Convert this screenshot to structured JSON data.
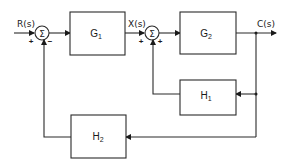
{
  "diagram": {
    "type": "control-system-block-diagram",
    "signals": {
      "input": "R(s)",
      "intermediate": "X(s)",
      "output": "C(s)"
    },
    "summing_junctions": [
      {
        "id": "sum1",
        "symbol": "Σ",
        "signs": {
          "left": "+",
          "bottom": "−"
        }
      },
      {
        "id": "sum2",
        "symbol": "Σ",
        "signs": {
          "left": "+",
          "bottom": "+"
        }
      }
    ],
    "blocks": [
      {
        "id": "G1",
        "letter": "G",
        "sub": "1",
        "role": "forward"
      },
      {
        "id": "G2",
        "letter": "G",
        "sub": "2",
        "role": "forward"
      },
      {
        "id": "H1",
        "letter": "H",
        "sub": "1",
        "role": "feedback-inner"
      },
      {
        "id": "H2",
        "letter": "H",
        "sub": "2",
        "role": "feedback-outer"
      }
    ],
    "connections": [
      "R(s) → sum1(+)",
      "sum1 → G1",
      "G1 → X(s) → sum2(+)",
      "sum2 → G2",
      "G2 → C(s)",
      "C(s) → H1 → sum2(+)",
      "C(s) → H2 → sum1(−)"
    ]
  }
}
